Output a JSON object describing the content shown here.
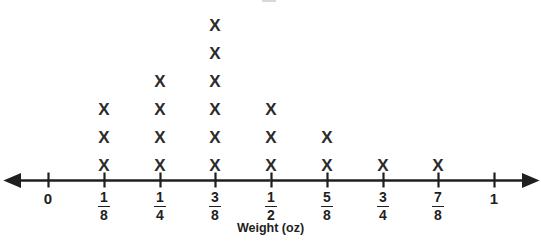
{
  "chart_data": {
    "type": "dot_plot",
    "title": "",
    "xlabel": "Weight (oz)",
    "ylabel": "",
    "marker": "X",
    "axis_style": "number-line-with-arrows",
    "grid": false,
    "legend": false,
    "categories": [
      "0",
      "1/8",
      "1/4",
      "3/8",
      "1/2",
      "5/8",
      "3/4",
      "7/8",
      "1"
    ],
    "values": [
      0,
      3,
      4,
      6,
      3,
      2,
      1,
      1,
      0
    ],
    "total_count": 20,
    "xlim": [
      "0",
      "1"
    ],
    "tick_labels": [
      {
        "name": "tick-0",
        "whole": "0",
        "numerator": "",
        "denominator": "",
        "is_fraction": false,
        "x": 48,
        "count": 0
      },
      {
        "name": "tick-1-8",
        "whole": "",
        "numerator": "1",
        "denominator": "8",
        "is_fraction": true,
        "x": 104,
        "count": 3
      },
      {
        "name": "tick-1-4",
        "whole": "",
        "numerator": "1",
        "denominator": "4",
        "is_fraction": true,
        "x": 160,
        "count": 4
      },
      {
        "name": "tick-3-8",
        "whole": "",
        "numerator": "3",
        "denominator": "8",
        "is_fraction": true,
        "x": 215,
        "count": 6
      },
      {
        "name": "tick-1-2",
        "whole": "",
        "numerator": "1",
        "denominator": "2",
        "is_fraction": true,
        "x": 271,
        "count": 3
      },
      {
        "name": "tick-5-8",
        "whole": "",
        "numerator": "5",
        "denominator": "8",
        "is_fraction": true,
        "x": 327,
        "count": 2
      },
      {
        "name": "tick-3-4",
        "whole": "",
        "numerator": "3",
        "denominator": "4",
        "is_fraction": true,
        "x": 383,
        "count": 1
      },
      {
        "name": "tick-7-8",
        "whole": "",
        "numerator": "7",
        "denominator": "8",
        "is_fraction": true,
        "x": 438,
        "count": 1
      },
      {
        "name": "tick-1",
        "whole": "1",
        "numerator": "",
        "denominator": "",
        "is_fraction": false,
        "x": 494,
        "count": 0
      }
    ],
    "colors": {
      "marker": "#2b2b2b",
      "axis": "#1f1f1f",
      "label": "#1f1f1f",
      "background": "#ffffff"
    }
  },
  "axis": {
    "title": "Weight (oz)",
    "line_y": 180,
    "left_arrow_x": 13,
    "right_arrow_x": 530
  }
}
